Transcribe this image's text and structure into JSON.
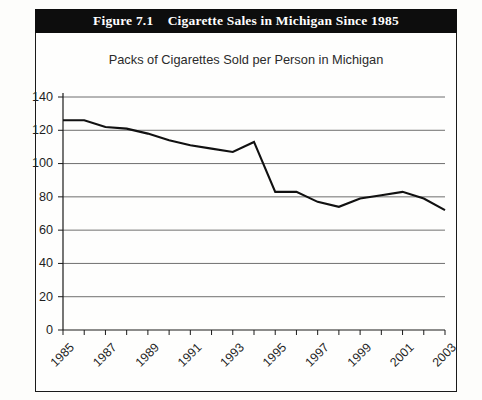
{
  "figure": {
    "title": "Figure 7.1    Cigarette Sales in Michigan Since 1985",
    "title_bar_color": "#0d0d0d",
    "title_text_color": "#ffffff",
    "frame_color": "#1a1a1a"
  },
  "chart_data": {
    "type": "line",
    "title": "Packs of Cigarettes Sold per Person in Michigan",
    "subtitle": "",
    "xlabel": "",
    "ylabel": "",
    "ylim": [
      0,
      140
    ],
    "ytick_labels": [
      "0",
      "20",
      "40",
      "60",
      "80",
      "100",
      "120",
      "140"
    ],
    "yticks": [
      0,
      20,
      40,
      60,
      80,
      100,
      120,
      140
    ],
    "xtick_labels": [
      "1985",
      "1987",
      "1989",
      "1991",
      "1993",
      "1995",
      "1997",
      "1999",
      "2001",
      "2003"
    ],
    "xtick_label_rotation": -45,
    "x": [
      1985,
      1986,
      1987,
      1988,
      1989,
      1990,
      1991,
      1992,
      1993,
      1994,
      1995,
      1996,
      1997,
      1998,
      1999,
      2000,
      2001,
      2002,
      2003
    ],
    "values": [
      126,
      126,
      122,
      121,
      118,
      114,
      111,
      109,
      107,
      113,
      83,
      83,
      77,
      74,
      79,
      81,
      83,
      79,
      72
    ],
    "series": [
      {
        "name": "Packs of Cigarettes Sold per Person in Michigan",
        "color": "#111111",
        "values": [
          126,
          126,
          122,
          121,
          118,
          114,
          111,
          109,
          107,
          113,
          83,
          83,
          77,
          74,
          79,
          81,
          83,
          79,
          72
        ]
      }
    ],
    "grid": true,
    "grid_axis": "y",
    "legend": false,
    "legend_position": "none",
    "line_color": "#111111",
    "markers": false
  }
}
